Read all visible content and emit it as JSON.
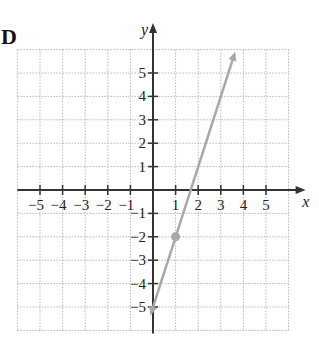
{
  "label": "D",
  "chart_data": {
    "type": "line",
    "title": "",
    "xlabel": "x",
    "ylabel": "y",
    "xlim": [
      -6,
      6
    ],
    "ylim": [
      -6,
      6
    ],
    "grid": true,
    "x_ticks": [
      -5,
      -4,
      -3,
      -2,
      -1,
      1,
      2,
      3,
      4,
      5
    ],
    "y_ticks": [
      5,
      4,
      3,
      2,
      1,
      -1,
      -2,
      -3,
      -4,
      -5
    ],
    "x_tick_labels": [
      "−5",
      "−4",
      "−3",
      "−2",
      "−1",
      "1",
      "2",
      "3",
      "4",
      "5"
    ],
    "y_tick_labels": [
      "5",
      "4",
      "3",
      "2",
      "1",
      "−1",
      "−2",
      "−3",
      "−4",
      "−5"
    ],
    "series": [
      {
        "name": "y = 3x − 5",
        "equation": "y = 3x - 5",
        "slope": 3,
        "intercept": -5,
        "x": [
          0.27,
          3.6
        ],
        "y": [
          -4.2,
          5.8
        ],
        "color": "#a8a8a8",
        "marked_points": [
          {
            "x": 1,
            "y": -2
          }
        ],
        "arrows": "both"
      }
    ]
  }
}
